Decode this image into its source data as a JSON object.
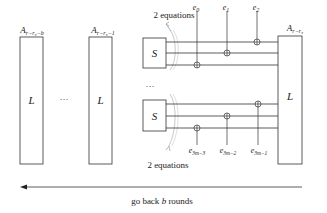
{
  "diagram": {
    "left_boxes": [
      {
        "label": "L",
        "title_base": "A",
        "title_sub": "r−r₃−b"
      },
      {
        "label": "L",
        "title_base": "A",
        "title_sub": "r−r₃−1"
      }
    ],
    "left_ellipsis": "···",
    "s_boxes": [
      {
        "label": "S"
      },
      {
        "label": "S"
      }
    ],
    "middle_ellipsis": "···",
    "right_box": {
      "label": "L",
      "title_base": "A",
      "title_sub": "r−r₃"
    },
    "top_annotation": "2 equations",
    "bottom_annotation": "2 equations",
    "top_xor_labels": [
      {
        "base": "e",
        "sub": "0"
      },
      {
        "base": "e",
        "sub": "1"
      },
      {
        "base": "e",
        "sub": "2"
      }
    ],
    "bottom_xor_labels": [
      {
        "base": "e",
        "sub": "3m−3"
      },
      {
        "base": "e",
        "sub": "3m−2"
      },
      {
        "base": "e",
        "sub": "3m−1"
      }
    ],
    "arrow_label": "go back b rounds",
    "arrow_label_parts": {
      "pre": "go back ",
      "var": "b",
      "post": " rounds"
    },
    "colors": {
      "line": "#333333",
      "bracket": "#9a9a9a"
    }
  }
}
